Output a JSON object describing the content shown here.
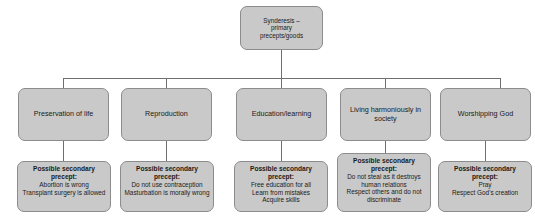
{
  "diagram": {
    "title_node": {
      "lines": [
        "Synderesis –",
        "primary",
        "precepts/goods"
      ]
    },
    "branches": [
      {
        "label": "Preservation of life"
      },
      {
        "label": "Reproduction"
      },
      {
        "label": "Education/learning"
      },
      {
        "label": "Living harmoniously in society"
      },
      {
        "label": "Worshipping God"
      }
    ],
    "leaves": [
      {
        "heading": "Possible secondary precept:",
        "lines": [
          "Abortion is wrong",
          "Transplant surgery is allowed"
        ]
      },
      {
        "heading": "Possible secondary precept:",
        "lines": [
          "Do not use contraception",
          "Masturbation is morally wrong"
        ]
      },
      {
        "heading": "Possible secondary precept:",
        "lines": [
          "Free education for all",
          "Learn from mistakes",
          "Acquire skills"
        ]
      },
      {
        "heading": "Possible secondary precept:",
        "lines": [
          "Do not steal as it destroys human relations",
          "Respect others and do not discriminate"
        ]
      },
      {
        "heading": "Possible secondary precept:",
        "lines": [
          "Pray",
          "Respect God's creation"
        ]
      }
    ],
    "colors": {
      "node_fill": "#c9c9c9",
      "node_border": "#8c8c8c",
      "connector": "#6f6f6f",
      "text": "#1a1a1a",
      "background": "#ffffff"
    }
  }
}
